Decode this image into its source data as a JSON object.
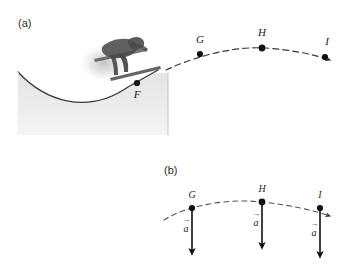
{
  "figure": {
    "panels": [
      {
        "id": "a",
        "label": "(a)",
        "caption_points": [
          "F",
          "G",
          "H",
          "I"
        ],
        "points": [
          {
            "name": "F",
            "label": "F",
            "x": 137,
            "y": 83,
            "label_x": 137,
            "label_y": 98
          },
          {
            "name": "G",
            "label": "G",
            "x": 200,
            "y": 54,
            "label_x": 200,
            "label_y": 43
          },
          {
            "name": "H",
            "label": "H",
            "x": 262,
            "y": 48,
            "label_x": 262,
            "label_y": 36
          },
          {
            "name": "I",
            "label": "I",
            "x": 325,
            "y": 57,
            "label_x": 325,
            "label_y": 45
          }
        ],
        "ramp": {
          "name": "ski-jump-ramp",
          "fill_color": "#e9e9e9",
          "edge_color": "#3a3a3a"
        },
        "trajectory": {
          "name": "projectile-trajectory",
          "style": "dashed",
          "color": "#3a3a3a"
        },
        "skier": {
          "name": "ski-jumper-silhouette",
          "color": "#4a4a4a"
        }
      },
      {
        "id": "b",
        "label": "(b)",
        "points": [
          {
            "name": "G",
            "label": "G",
            "x": 192,
            "y": 208,
            "label_x": 192,
            "label_y": 198
          },
          {
            "name": "H",
            "label": "H",
            "x": 262,
            "y": 202,
            "label_x": 262,
            "label_y": 192
          },
          {
            "name": "I",
            "label": "I",
            "x": 320,
            "y": 208,
            "label_x": 320,
            "label_y": 198
          }
        ],
        "vectors": [
          {
            "name": "acceleration-vector-g",
            "label": "a",
            "x": 192,
            "y_start": 208,
            "y_end": 255,
            "label_x": 185,
            "label_y": 228
          },
          {
            "name": "acceleration-vector-h",
            "label": "a",
            "x": 262,
            "y_start": 202,
            "y_end": 248,
            "label_x": 255,
            "label_y": 222
          },
          {
            "name": "acceleration-vector-i",
            "label": "a",
            "x": 320,
            "y_start": 208,
            "y_end": 257,
            "label_x": 313,
            "label_y": 232
          }
        ],
        "trajectory": {
          "name": "projectile-trajectory",
          "style": "dashed",
          "color": "#555555"
        }
      }
    ]
  },
  "colors": {
    "background": "#ffffff",
    "ramp_fill": "#e9e9e9",
    "ramp_edge": "#3a3a3a",
    "dash_line": "#3a3a3a",
    "point_dot": "#111111",
    "skier": "#4a4a4a",
    "label_text": "#2b2b2b"
  }
}
